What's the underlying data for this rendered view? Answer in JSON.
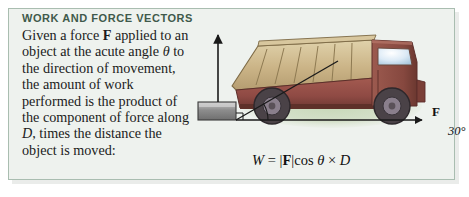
{
  "panel": {
    "heading": "WORK AND FORCE VECTORS",
    "background_color": "#eef2ee",
    "border_color": "#a9bdb0",
    "heading_color": "#3f5a4b"
  },
  "body": {
    "line1_pre": "Given a force ",
    "line1_bold": "F",
    "line1_post": " applied",
    "line2": "to an object at the acute",
    "line3_pre": "angle ",
    "line3_italic": "θ",
    "line3_post": " to the direction",
    "line4": "of movement, the amount",
    "line5": "of work performed is the",
    "line6": "product of the component",
    "line7_pre": "of force along ",
    "line7_italic": "D",
    "line7_post": ", times",
    "line8": "the distance the object is",
    "line9": "moved:"
  },
  "formula": {
    "w": "W",
    "equals": "=",
    "bar_open": "|",
    "f_bold": "F",
    "bar_close": "|",
    "cos": "cos ",
    "theta": "θ",
    "times": "×",
    "d": "D"
  },
  "figure": {
    "force_label": "F",
    "angle_label": "30°",
    "distance_label": "D",
    "projection_bar_open": "|",
    "projection_f": "F",
    "projection_bar_close": "|",
    "projection_cos": "cos ",
    "projection_theta": "θ",
    "colors": {
      "truck_body": "#8f4a44",
      "truck_bed": "#cbb487",
      "wheel": "#4a4247",
      "window": "#cfe4f2",
      "ground_shadow": "#cfdcc2",
      "block": "#9a9a9a",
      "arrow": "#1a1a1a"
    }
  }
}
